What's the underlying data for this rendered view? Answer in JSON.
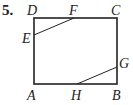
{
  "problem_number": "5.",
  "figure": {
    "type": "rectangle-with-segments",
    "rectangle": {
      "vertices": [
        "A",
        "B",
        "C",
        "D"
      ]
    },
    "points": {
      "A": {
        "x": 34,
        "y": 84,
        "label_x": 27,
        "label_y": 100
      },
      "B": {
        "x": 117,
        "y": 84,
        "label_x": 112,
        "label_y": 100
      },
      "C": {
        "x": 117,
        "y": 18,
        "label_x": 111,
        "label_y": 15
      },
      "D": {
        "x": 34,
        "y": 18,
        "label_x": 27,
        "label_y": 15
      },
      "E": {
        "x": 34,
        "y": 35,
        "label_x": 22,
        "label_y": 43
      },
      "F": {
        "x": 74,
        "y": 18,
        "label_x": 69,
        "label_y": 15
      },
      "G": {
        "x": 117,
        "y": 67,
        "label_x": 119,
        "label_y": 68
      },
      "H": {
        "x": 77,
        "y": 84,
        "label_x": 71,
        "label_y": 100
      }
    },
    "segments": [
      [
        "E",
        "F"
      ],
      [
        "G",
        "H"
      ]
    ],
    "labels": {
      "A": "A",
      "B": "B",
      "C": "C",
      "D": "D",
      "E": "E",
      "F": "F",
      "G": "G",
      "H": "H"
    }
  }
}
